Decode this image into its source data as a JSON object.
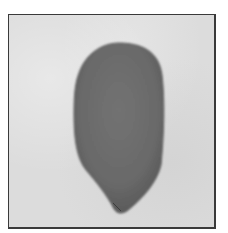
{
  "image": {
    "description": "Grayscale photograph of a single smooth elongated seed-like object with a rounded top and a tapered pointed bottom, on a light mottled background inside a thin dark border frame",
    "subject": "seed",
    "colors": {
      "background": "#dcdcdc",
      "frame_border": "#3a3a3a",
      "object_fill": "#6e6e6e",
      "object_edge": "#585858",
      "page": "#ffffff"
    }
  }
}
